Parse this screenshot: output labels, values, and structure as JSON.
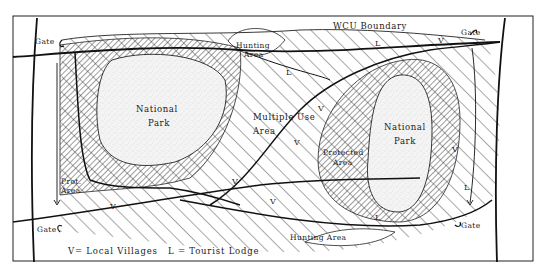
{
  "diagram": {
    "title": "WCU Boundary",
    "labels": {
      "wcu_boundary": "WCU Boundary",
      "hunting_area_top_line1": "Hunting",
      "hunting_area_top_line2": "Area",
      "hunting_area_bottom": "Hunting Area",
      "national_park_left_line1": "National",
      "national_park_left_line2": "Park",
      "national_park_right_line1": "National",
      "national_park_right_line2": "Park",
      "multiple_use_line1": "Multiple",
      "multiple_use_line2": "Area",
      "multiple_use_word": "Use",
      "protected_area_right_line1": "Protected",
      "protected_area_right_line2": "Area",
      "protected_area_left_line1": "Prot.",
      "protected_area_left_line2": "Area",
      "gate_top_left": "Gate",
      "gate_top_right": "Gate",
      "gate_bottom_left": "Gate",
      "gate_bottom_right": "Gate"
    },
    "symbols": {
      "village": "V",
      "lodge": "L"
    },
    "legend": {
      "villages": "V= Local Villages",
      "lodge": "L = Tourist Lodge"
    },
    "zones": [
      {
        "name": "National Park",
        "fill": "stipple"
      },
      {
        "name": "Protected Area",
        "fill": "fine-diagonal-hatch"
      },
      {
        "name": "Multiple Use Area",
        "fill": "wide-diagonal-hatch"
      },
      {
        "name": "Hunting Area",
        "fill": "blank"
      }
    ],
    "colors": {
      "ink": "#1a1a1a",
      "paper": "#ffffff",
      "stipple": "#f2f2f2"
    }
  }
}
